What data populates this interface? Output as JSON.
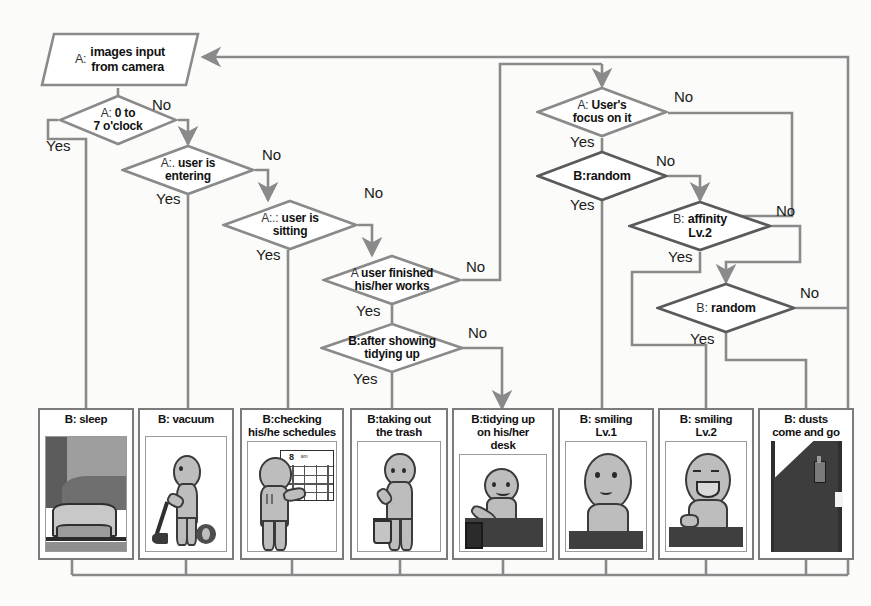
{
  "diagram": {
    "background_color": "#fbfbf9",
    "wire_color": "#8a8a8a",
    "wire_color_dark": "#4a4a4a"
  },
  "input_node": {
    "prefix": "A:",
    "line1": "images input",
    "line2": "from camera"
  },
  "decisions": [
    {
      "id": "time",
      "prefix": "A:",
      "line1": "0 to",
      "line2": "7 o'clock",
      "yes": "Yes",
      "no": "No"
    },
    {
      "id": "entering",
      "prefix": "A:.",
      "line1": "user is",
      "line2": "entering",
      "yes": "Yes",
      "no": "No"
    },
    {
      "id": "sitting",
      "prefix": "A:.:",
      "line1": "user is",
      "line2": "sitting",
      "yes": "Yes",
      "no": "No"
    },
    {
      "id": "finished",
      "prefix": "A",
      "line1": "user finished",
      "line2": "his/her works",
      "yes": "Yes",
      "no": "No"
    },
    {
      "id": "tidyshow",
      "prefix": "",
      "line1": "B:after showing",
      "line2": "tidying up",
      "yes": "Yes",
      "no": "No"
    },
    {
      "id": "focus",
      "prefix": "A:",
      "line1": "User's",
      "line2": "focus on it",
      "yes": "Yes",
      "no": "No"
    },
    {
      "id": "random1",
      "prefix": "",
      "line1": "B:random",
      "line2": "",
      "yes": "Yes",
      "no": "No"
    },
    {
      "id": "affinity",
      "prefix": "B:",
      "line1": "affinity",
      "line2": "Lv.2",
      "yes": "Yes",
      "no": "No"
    },
    {
      "id": "random2",
      "prefix": "B:",
      "line1": "random",
      "line2": "",
      "yes": "Yes",
      "no": "No"
    }
  ],
  "behaviours": [
    {
      "id": "sleep",
      "line1": "B: sleep",
      "line2": "",
      "line3": ""
    },
    {
      "id": "vacuum",
      "line1": "B: vacuum",
      "line2": "",
      "line3": ""
    },
    {
      "id": "schedule",
      "line1": "B:checking",
      "line2": "his/he schedules",
      "line3": ""
    },
    {
      "id": "trash",
      "line1": "B:taking out",
      "line2": "the trash",
      "line3": ""
    },
    {
      "id": "desk",
      "line1": "B:tidying up",
      "line2": "on his/her",
      "line3": "desk"
    },
    {
      "id": "smile1",
      "line1": "B: smiling",
      "line2": "Lv.1",
      "line3": ""
    },
    {
      "id": "smile2",
      "line1": "B: smiling",
      "line2": "Lv.2",
      "line3": ""
    },
    {
      "id": "dusts",
      "line1": "B: dusts",
      "line2": "come and go",
      "line3": ""
    }
  ],
  "schedule_art": {
    "number": "8",
    "caption": "am"
  }
}
